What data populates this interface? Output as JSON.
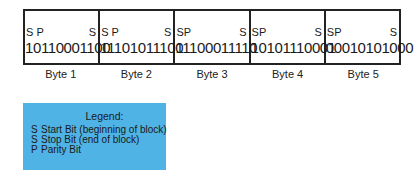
{
  "diagram": {
    "bytes": [
      {
        "label": "Byte 1",
        "start_marks": "S P",
        "end_mark": "S",
        "bits": "10110001100"
      },
      {
        "label": "Byte 2",
        "start_marks": "S P",
        "end_mark": "S",
        "bits": "11101011100"
      },
      {
        "label": "Byte 3",
        "start_marks": "SP",
        "end_mark": "S",
        "bits": "11100011110"
      },
      {
        "label": "Byte 4",
        "start_marks": "SP",
        "end_mark": "S",
        "bits": "10101110001"
      },
      {
        "label": "Byte 5",
        "start_marks": "SP",
        "end_mark": "S",
        "bits": "00010101000"
      }
    ],
    "legend": {
      "title": "Legend:",
      "items": [
        {
          "symbol": "S",
          "text": "Start Bit (beginning of block)"
        },
        {
          "symbol": "S",
          "text": "Stop Bit (end of block)"
        },
        {
          "symbol": "P",
          "text": "Parity Bit"
        }
      ],
      "background_color": "#4fb3e5"
    }
  }
}
